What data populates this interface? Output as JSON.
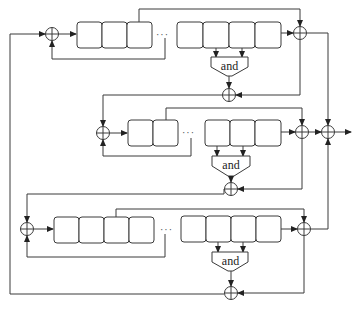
{
  "diagram": {
    "type": "cascaded shift-register keystream generator",
    "colors": {
      "stroke": "#3a3a3a",
      "background": "#ffffff"
    },
    "gate_label": "and",
    "ellipsis": "···",
    "rows": [
      {
        "name": "top",
        "left_cells": 3,
        "right_cells": 4,
        "gate_label": "and"
      },
      {
        "name": "middle",
        "left_cells": 2,
        "right_cells": 3,
        "gate_label": "and"
      },
      {
        "name": "bottom",
        "left_cells": 4,
        "right_cells": 4,
        "gate_label": "and"
      }
    ],
    "xor_symbol": "⊕"
  }
}
